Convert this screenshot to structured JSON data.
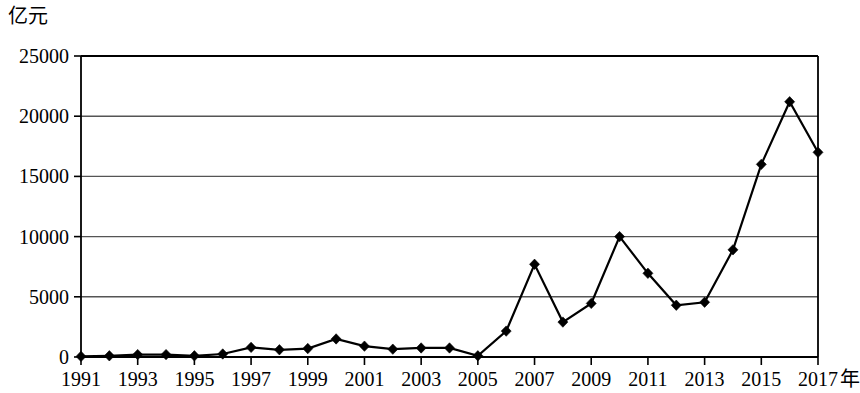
{
  "chart_data": {
    "type": "line",
    "title": "",
    "subtitle": "",
    "xlabel": "年",
    "ylabel": "亿元",
    "grid": true,
    "legend": null,
    "marker": "diamond",
    "line_color": "#000000",
    "axis_color": "#000000",
    "grid_color": "#555555",
    "xlim": [
      1991,
      2017
    ],
    "ylim": [
      0,
      25000
    ],
    "y_ticks": [
      0,
      5000,
      10000,
      15000,
      20000,
      25000
    ],
    "y_tick_labels": [
      "0",
      "5000",
      "10000",
      "15000",
      "20000",
      "25000"
    ],
    "x_ticks": [
      1991,
      1993,
      1995,
      1997,
      1999,
      2001,
      2003,
      2005,
      2007,
      2009,
      2011,
      2013,
      2015,
      2017
    ],
    "x_tick_labels": [
      "1991",
      "1993",
      "1995",
      "1997",
      "1999",
      "2001",
      "2003",
      "2005",
      "2007",
      "2009",
      "2011",
      "2013",
      "2015",
      "2017"
    ],
    "x": [
      1991,
      1992,
      1993,
      1994,
      1995,
      1996,
      1997,
      1998,
      1999,
      2000,
      2001,
      2002,
      2003,
      2004,
      2005,
      2006,
      2007,
      2008,
      2009,
      2010,
      2011,
      2012,
      2013,
      2014,
      2015,
      2016,
      2017
    ],
    "values": [
      50,
      100,
      200,
      200,
      100,
      250,
      800,
      600,
      700,
      1500,
      900,
      650,
      750,
      750,
      100,
      2150,
      7700,
      2900,
      4450,
      10000,
      6950,
      4300,
      4550,
      8900,
      16000,
      21200,
      17000
    ]
  }
}
